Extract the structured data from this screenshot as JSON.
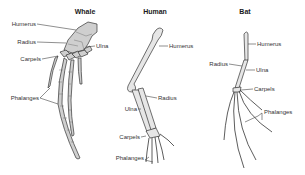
{
  "diagram": {
    "panels": [
      {
        "title": "Whale",
        "labels": [
          "Humerus",
          "Radius",
          "Ulna",
          "Carpels",
          "Phalanges"
        ]
      },
      {
        "title": "Human",
        "labels": [
          "Humerus",
          "Radius",
          "Ulna",
          "Carpels",
          "Phalanges"
        ]
      },
      {
        "title": "Bat",
        "labels": [
          "Humerus",
          "Radius",
          "Ulna",
          "Carpels",
          "Phalanges"
        ]
      }
    ],
    "colors": {
      "bone_fill": "#cfcfcf",
      "outline": "#333333",
      "background": "#ffffff"
    }
  }
}
